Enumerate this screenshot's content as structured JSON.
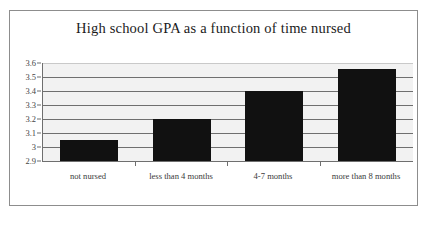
{
  "chart_data": {
    "type": "bar",
    "title": "High school GPA as a function of time nursed",
    "xlabel": "",
    "ylabel": "",
    "categories": [
      "not nursed",
      "less than 4 months",
      "4-7 months",
      "more than 8 months"
    ],
    "values": [
      3.05,
      3.2,
      3.4,
      3.56
    ],
    "ylim": [
      2.9,
      3.6
    ],
    "ytick_labels": [
      "3.6",
      "3.5",
      "3.4",
      "3.3",
      "3.2",
      "3.1",
      "3",
      "2.9"
    ],
    "ytick_values": [
      3.6,
      3.5,
      3.4,
      3.3,
      3.2,
      3.1,
      3.0,
      2.9
    ],
    "grid": true,
    "legend": false,
    "series": [
      {
        "name": "High school GPA",
        "values": [
          3.05,
          3.2,
          3.4,
          3.56
        ]
      }
    ],
    "colors": {
      "bar": "#111111",
      "plot_background": "#f2f2f2",
      "grid_line": "#6f6f6f",
      "axis_line": "#6f6f6f",
      "frame_border": "#8d8d8d",
      "title_text": "#1b1b1b",
      "tick_text": "#454545"
    }
  }
}
